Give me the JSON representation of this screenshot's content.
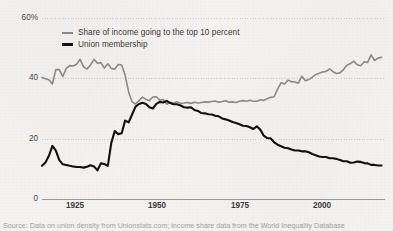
{
  "chart_data": {
    "type": "line",
    "title": "",
    "subtitle": "",
    "xlabel": "",
    "ylabel": "",
    "xlim": [
      1917,
      2016
    ],
    "ylim": [
      0,
      60
    ],
    "grid": true,
    "grid_axis": "y",
    "legend_position": "top-left-inside",
    "y_ticks": [
      "60%",
      "40",
      "20",
      "0"
    ],
    "y_tick_values": [
      60,
      40,
      20,
      0
    ],
    "x_ticks": [
      "1925",
      "1950",
      "1975",
      "2000"
    ],
    "x_tick_values": [
      1925,
      1950,
      1975,
      2000
    ],
    "series": [
      {
        "name": "Share of income going to the top 10 percent",
        "color": "#8c8c8c",
        "width": 1.6,
        "x": [
          1917,
          1918,
          1919,
          1920,
          1921,
          1922,
          1923,
          1924,
          1925,
          1926,
          1927,
          1928,
          1929,
          1930,
          1931,
          1932,
          1933,
          1934,
          1935,
          1936,
          1937,
          1938,
          1939,
          1940,
          1941,
          1942,
          1943,
          1944,
          1945,
          1946,
          1947,
          1948,
          1949,
          1950,
          1951,
          1952,
          1953,
          1954,
          1955,
          1956,
          1957,
          1958,
          1959,
          1960,
          1961,
          1962,
          1963,
          1964,
          1965,
          1966,
          1967,
          1968,
          1969,
          1970,
          1971,
          1972,
          1973,
          1974,
          1975,
          1976,
          1977,
          1978,
          1979,
          1980,
          1981,
          1982,
          1983,
          1984,
          1985,
          1986,
          1987,
          1988,
          1989,
          1990,
          1991,
          1992,
          1993,
          1994,
          1995,
          1996,
          1997,
          1998,
          1999,
          2000,
          2001,
          2002,
          2003,
          2004,
          2005,
          2006,
          2007,
          2008,
          2009,
          2010,
          2011,
          2012,
          2013,
          2014,
          2015
        ],
        "y": [
          40.3,
          39.9,
          39.5,
          38.1,
          42.9,
          42.9,
          40.6,
          43.3,
          44.2,
          44.1,
          44.7,
          46.3,
          43.8,
          43.1,
          44.4,
          46.3,
          45.0,
          45.2,
          43.4,
          44.8,
          43.3,
          43.0,
          44.6,
          44.4,
          41.0,
          35.5,
          32.2,
          31.5,
          32.6,
          33.8,
          33.0,
          32.6,
          33.8,
          33.9,
          32.8,
          33.0,
          31.4,
          32.1,
          31.8,
          32.2,
          31.7,
          31.8,
          32.0,
          31.7,
          32.1,
          31.8,
          32.0,
          32.2,
          32.1,
          32.3,
          32.5,
          32.1,
          32.3,
          32.6,
          32.1,
          32.2,
          32.0,
          32.4,
          32.6,
          32.4,
          32.7,
          32.4,
          32.4,
          32.9,
          32.7,
          33.2,
          33.7,
          33.9,
          36.4,
          38.5,
          38.1,
          39.4,
          38.9,
          38.8,
          38.4,
          40.7,
          39.2,
          39.6,
          40.4,
          41.2,
          41.7,
          42.1,
          42.3,
          43.1,
          42.2,
          41.6,
          41.8,
          42.9,
          44.3,
          44.9,
          45.7,
          44.5,
          44.2,
          45.5,
          45.3,
          47.8,
          45.9,
          46.7,
          47.0
        ]
      },
      {
        "name": "Union membership",
        "color": "#111111",
        "width": 2.1,
        "x": [
          1917,
          1918,
          1919,
          1920,
          1921,
          1922,
          1923,
          1924,
          1925,
          1926,
          1927,
          1928,
          1929,
          1930,
          1931,
          1932,
          1933,
          1934,
          1935,
          1936,
          1937,
          1938,
          1939,
          1940,
          1941,
          1942,
          1943,
          1944,
          1945,
          1946,
          1947,
          1948,
          1949,
          1950,
          1951,
          1952,
          1953,
          1954,
          1955,
          1956,
          1957,
          1958,
          1959,
          1960,
          1961,
          1962,
          1963,
          1964,
          1965,
          1966,
          1967,
          1968,
          1969,
          1970,
          1971,
          1972,
          1973,
          1974,
          1975,
          1976,
          1977,
          1978,
          1979,
          1980,
          1981,
          1982,
          1983,
          1984,
          1985,
          1986,
          1987,
          1988,
          1989,
          1990,
          1991,
          1992,
          1993,
          1994,
          1995,
          1996,
          1997,
          1998,
          1999,
          2000,
          2001,
          2002,
          2003,
          2004,
          2005,
          2006,
          2007,
          2008,
          2009,
          2010,
          2011,
          2012,
          2013,
          2014,
          2015
        ],
        "y": [
          11.0,
          12.1,
          14.3,
          17.6,
          16.0,
          12.9,
          11.5,
          11.3,
          11.0,
          10.8,
          10.6,
          10.6,
          10.4,
          10.7,
          11.2,
          10.8,
          9.5,
          11.8,
          11.6,
          11.0,
          18.6,
          22.5,
          21.5,
          21.8,
          26.0,
          25.4,
          28.0,
          30.6,
          31.5,
          31.9,
          31.5,
          30.4,
          30.0,
          31.5,
          32.2,
          32.0,
          32.5,
          31.8,
          31.4,
          31.4,
          31.0,
          30.4,
          30.3,
          30.4,
          29.5,
          29.2,
          28.5,
          28.4,
          28.1,
          28.0,
          27.6,
          27.4,
          26.7,
          26.4,
          26.0,
          25.5,
          25.2,
          24.8,
          24.3,
          24.2,
          23.8,
          23.2,
          24.1,
          23.0,
          21.0,
          20.2,
          20.1,
          18.8,
          18.0,
          17.5,
          17.0,
          16.8,
          16.4,
          16.1,
          16.1,
          15.8,
          15.8,
          15.5,
          14.9,
          14.5,
          14.1,
          13.9,
          13.9,
          13.5,
          13.5,
          13.3,
          12.9,
          12.5,
          12.5,
          12.0,
          12.1,
          12.4,
          12.3,
          11.9,
          11.8,
          11.3,
          11.3,
          11.1,
          11.1
        ]
      }
    ]
  },
  "legend": {
    "items": [
      {
        "label": "Share of income going to the top 10 percent",
        "color": "#8c8c8c",
        "weight": "thin"
      },
      {
        "label": "Union membership",
        "color": "#111111",
        "weight": "thick"
      }
    ]
  },
  "axes": {
    "y_labels": [
      "60%",
      "40",
      "20",
      "0"
    ],
    "x_labels": [
      "1925",
      "1950",
      "1975",
      "2000"
    ]
  },
  "source": {
    "text": "Source: Data on union density from Unionstats.com; income share data from the World Inequality Database"
  },
  "colors": {
    "background": "#f4f3f1",
    "grid": "#cfcecb",
    "axis": "#9a9997",
    "income_share": "#8c8c8c",
    "union": "#111111",
    "tick_text": "#4a4a4a"
  }
}
